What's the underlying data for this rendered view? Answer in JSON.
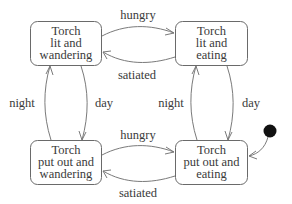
{
  "diagram": {
    "type": "state-machine",
    "states": [
      {
        "id": "lit_wandering",
        "lines": [
          "Torch",
          "lit and",
          "wandering"
        ]
      },
      {
        "id": "lit_eating",
        "lines": [
          "Torch",
          "lit and",
          "eating"
        ]
      },
      {
        "id": "out_wandering",
        "lines": [
          "Torch",
          "put out and",
          "wandering"
        ]
      },
      {
        "id": "out_eating",
        "lines": [
          "Torch",
          "put out and",
          "eating"
        ]
      }
    ],
    "transitions": [
      {
        "from": "lit_wandering",
        "to": "lit_eating",
        "label": "hungry"
      },
      {
        "from": "lit_eating",
        "to": "lit_wandering",
        "label": "satiated"
      },
      {
        "from": "out_wandering",
        "to": "lit_wandering",
        "label": "night"
      },
      {
        "from": "lit_wandering",
        "to": "out_wandering",
        "label": "day"
      },
      {
        "from": "out_eating",
        "to": "lit_eating",
        "label": "night"
      },
      {
        "from": "lit_eating",
        "to": "out_eating",
        "label": "day"
      },
      {
        "from": "out_wandering",
        "to": "out_eating",
        "label": "hungry"
      },
      {
        "from": "out_eating",
        "to": "out_wandering",
        "label": "satiated"
      }
    ],
    "initial_state": "out_eating",
    "colors": {
      "stroke": "#7a7a7a",
      "text": "#3a3a3a",
      "initial_dot": "#111111"
    }
  }
}
